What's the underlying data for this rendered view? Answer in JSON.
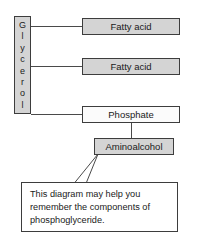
{
  "diagram": {
    "nodes": {
      "glycerol": {
        "label": "Glycerol",
        "letters": [
          "G",
          "l",
          "y",
          "c",
          "e",
          "r",
          "o",
          "l"
        ],
        "fill": "#d4d4d4",
        "orientation": "vertical"
      },
      "fatty_acid_1": {
        "label": "Fatty acid",
        "fill": "#d4d4d4"
      },
      "fatty_acid_2": {
        "label": "Fatty acid",
        "fill": "#d4d4d4"
      },
      "phosphate": {
        "label": "Phosphate",
        "fill": "#fbfbfb"
      },
      "aminoalcohol": {
        "label": "Aminoalcohol",
        "fill": "#d4d4d4"
      }
    },
    "connectors": [
      {
        "from": "glycerol",
        "to": "fatty_acid_1"
      },
      {
        "from": "glycerol",
        "to": "fatty_acid_2"
      },
      {
        "from": "glycerol",
        "to": "phosphate"
      },
      {
        "from": "phosphate",
        "to": "aminoalcohol"
      }
    ],
    "caption": {
      "line1": "This diagram may help you",
      "line2": "remember the components of",
      "line3": "phosphoglyceride."
    },
    "colors": {
      "stroke": "#3d3d3d",
      "connector": "#4a4a4a",
      "fill_gray": "#d4d4d4",
      "fill_white": "#fbfbfb",
      "text": "#1a1a1a",
      "background": "#ffffff"
    }
  }
}
